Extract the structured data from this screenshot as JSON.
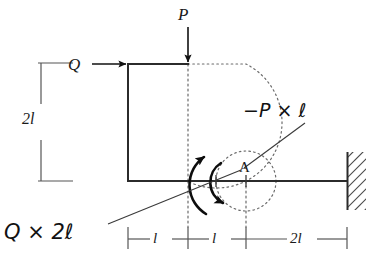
{
  "figure": {
    "kind": "structural-mechanics-free-body-diagram",
    "colors": {
      "background": "#ffffff",
      "beam_line": "#2b2b2b",
      "dimension_line": "#555555",
      "dotted_guide": "#6b6b6b",
      "arrow_load": "#111111",
      "moment_arrow": "#0d0d0d",
      "wall_hatch": "#4a4a4a",
      "annotation_text": "#111111"
    },
    "loads": [
      {
        "name": "vertical-load",
        "label": "P",
        "direction": "down",
        "applied_at": "top beam, 1l right of corner"
      },
      {
        "name": "horizontal-load",
        "label": "Q",
        "direction": "right",
        "applied_at": "top-left corner of beam"
      }
    ],
    "point_label": "A",
    "annotations": [
      {
        "name": "moment-from-P",
        "text": "−P × ℓ"
      },
      {
        "name": "moment-from-Q",
        "text": "Q × 2ℓ"
      }
    ],
    "dimensions": {
      "vertical_left": "2l",
      "horizontal": [
        "l",
        "l",
        "2l"
      ]
    }
  }
}
